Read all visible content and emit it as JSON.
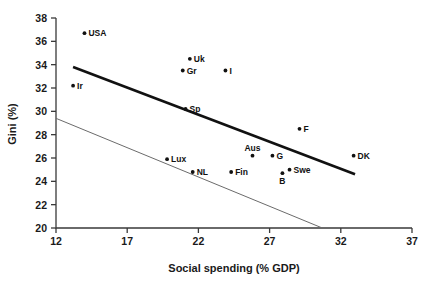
{
  "chart_data": {
    "type": "scatter",
    "title": "",
    "xlabel": "Social spending (% GDP)",
    "ylabel": "Gini (%)",
    "xlim": [
      12,
      37
    ],
    "ylim": [
      20,
      38
    ],
    "xticks": [
      12,
      17,
      22,
      27,
      32,
      37
    ],
    "yticks": [
      20,
      22,
      24,
      26,
      28,
      30,
      32,
      34,
      36,
      38
    ],
    "grid": false,
    "legend": "none",
    "points": [
      {
        "label": "USA",
        "x": 14.0,
        "y": 36.7,
        "label_pos": "right"
      },
      {
        "label": "Uk",
        "x": 21.4,
        "y": 34.5,
        "label_pos": "right"
      },
      {
        "label": "Gr",
        "x": 20.9,
        "y": 33.5,
        "label_pos": "right"
      },
      {
        "label": "I",
        "x": 23.9,
        "y": 33.5,
        "label_pos": "right"
      },
      {
        "label": "Ir",
        "x": 13.2,
        "y": 32.2,
        "label_pos": "right"
      },
      {
        "label": "Sp",
        "x": 21.1,
        "y": 30.2,
        "label_pos": "right"
      },
      {
        "label": "F",
        "x": 29.1,
        "y": 28.5,
        "label_pos": "right"
      },
      {
        "label": "Lux",
        "x": 19.8,
        "y": 25.9,
        "label_pos": "right"
      },
      {
        "label": "Aus",
        "x": 25.8,
        "y": 26.2,
        "label_pos": "above"
      },
      {
        "label": "G",
        "x": 27.2,
        "y": 26.2,
        "label_pos": "right"
      },
      {
        "label": "DK",
        "x": 32.9,
        "y": 26.2,
        "label_pos": "right"
      },
      {
        "label": "Swe",
        "x": 28.4,
        "y": 25.0,
        "label_pos": "right"
      },
      {
        "label": "B",
        "x": 27.9,
        "y": 24.7,
        "label_pos": "below"
      },
      {
        "label": "NL",
        "x": 21.6,
        "y": 24.8,
        "label_pos": "right"
      },
      {
        "label": "Fin",
        "x": 24.3,
        "y": 24.8,
        "label_pos": "right"
      }
    ],
    "lines": [
      {
        "name": "upper-trend",
        "style": "thick",
        "x1": 13.2,
        "y1": 33.8,
        "x2": 33.0,
        "y2": 24.6
      },
      {
        "name": "lower-trend",
        "style": "thin",
        "x1": 12.0,
        "y1": 29.4,
        "x2": 30.7,
        "y2": 20.0
      }
    ]
  },
  "axes": {
    "x_title": "Social spending (% GDP)",
    "y_title": "Gini (%)",
    "x_tick_labels": [
      "12",
      "17",
      "22",
      "27",
      "32",
      "37"
    ],
    "y_tick_labels": [
      "20",
      "22",
      "24",
      "26",
      "28",
      "30",
      "32",
      "34",
      "36",
      "38"
    ]
  },
  "colors": {
    "axis": "#3a3a3a",
    "point": "#111111",
    "thick_line": "#111111",
    "thin_line": "#6b6b6b",
    "background": "#ffffff"
  }
}
